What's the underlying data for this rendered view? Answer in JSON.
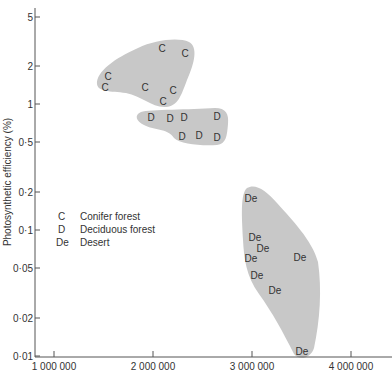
{
  "chart_data": {
    "type": "scatter",
    "title": "",
    "xlabel": "",
    "ylabel": "Photosynthetic efficiency (%)",
    "yscale": "log",
    "ylim": [
      0.01,
      6
    ],
    "xlim": [
      750000,
      4350000
    ],
    "grid": false,
    "y_ticks": [
      {
        "value": 5,
        "label": "5",
        "py": 17
      },
      {
        "value": 2,
        "label": "2",
        "py": 66
      },
      {
        "value": 1,
        "label": "1",
        "py": 104
      },
      {
        "value": 0.5,
        "label": "0·5",
        "py": 142
      },
      {
        "value": 0.2,
        "label": "0·2",
        "py": 192
      },
      {
        "value": 0.1,
        "label": "0·1",
        "py": 230
      },
      {
        "value": 0.05,
        "label": "0·05",
        "py": 268
      },
      {
        "value": 0.02,
        "label": "0·02",
        "py": 318
      },
      {
        "value": 0.01,
        "label": "0·01",
        "py": 356
      }
    ],
    "x_ticks": [
      {
        "value": 1000000,
        "label": "1 000 000",
        "px": 54
      },
      {
        "value": 2000000,
        "label": "2 000 000",
        "px": 153
      },
      {
        "value": 3000000,
        "label": "3 000 000",
        "px": 252
      },
      {
        "value": 4000000,
        "label": "4 000 000",
        "px": 351
      }
    ],
    "legend": {
      "position": "left-middle",
      "entries": [
        {
          "symbol": "C",
          "label": "Conifer forest"
        },
        {
          "symbol": "D",
          "label": "Deciduous forest"
        },
        {
          "symbol": "De",
          "label": "Desert"
        }
      ]
    },
    "series": [
      {
        "name": "Conifer forest",
        "symbol": "C",
        "points": [
          {
            "x": 1540000,
            "y": 1.55,
            "px": 108,
            "py": 76
          },
          {
            "x": 1510000,
            "y": 1.4,
            "px": 105,
            "py": 87
          },
          {
            "x": 2080000,
            "y": 2.5,
            "px": 162,
            "py": 48
          },
          {
            "x": 2310000,
            "y": 2.3,
            "px": 185,
            "py": 53
          },
          {
            "x": 1920000,
            "y": 1.4,
            "px": 145,
            "py": 87
          },
          {
            "x": 2200000,
            "y": 1.3,
            "px": 173,
            "py": 90
          },
          {
            "x": 2100000,
            "y": 1.05,
            "px": 163,
            "py": 101
          }
        ]
      },
      {
        "name": "Deciduous forest",
        "symbol": "D",
        "points": [
          {
            "x": 1980000,
            "y": 0.78,
            "px": 151,
            "py": 117
          },
          {
            "x": 2180000,
            "y": 0.76,
            "px": 170,
            "py": 118
          },
          {
            "x": 2320000,
            "y": 0.77,
            "px": 184,
            "py": 117
          },
          {
            "x": 2640000,
            "y": 0.79,
            "px": 217,
            "py": 116
          },
          {
            "x": 2290000,
            "y": 0.55,
            "px": 182,
            "py": 136
          },
          {
            "x": 2460000,
            "y": 0.56,
            "px": 199,
            "py": 135
          },
          {
            "x": 2640000,
            "y": 0.54,
            "px": 217,
            "py": 137
          }
        ]
      },
      {
        "name": "Desert",
        "symbol": "De",
        "points": [
          {
            "x": 2990000,
            "y": 0.19,
            "px": 251,
            "py": 198
          },
          {
            "x": 3030000,
            "y": 0.088,
            "px": 255,
            "py": 237
          },
          {
            "x": 3120000,
            "y": 0.073,
            "px": 263,
            "py": 248
          },
          {
            "x": 3000000,
            "y": 0.063,
            "px": 251,
            "py": 258
          },
          {
            "x": 3490000,
            "y": 0.063,
            "px": 300,
            "py": 257
          },
          {
            "x": 3050000,
            "y": 0.048,
            "px": 257,
            "py": 275
          },
          {
            "x": 3230000,
            "y": 0.04,
            "px": 275,
            "py": 290
          },
          {
            "x": 3500000,
            "y": 0.011,
            "px": 302,
            "py": 351
          }
        ]
      }
    ]
  }
}
